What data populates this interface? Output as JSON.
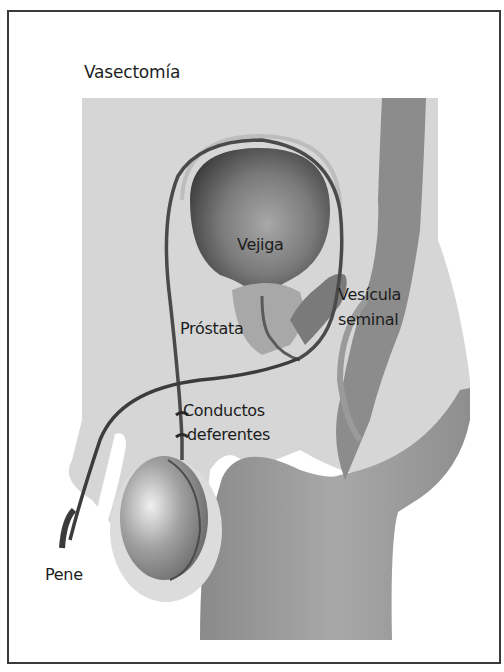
{
  "figure": {
    "title": "Vasectomía",
    "labels": {
      "bladder": "Vejiga",
      "seminal_vesicle_line1": "Vesícula",
      "seminal_vesicle_line2": "seminal",
      "prostate": "Próstata",
      "vas_deferens_line1": "Conductos",
      "vas_deferens_line2": "deferentes",
      "penis": "Pene"
    },
    "colors": {
      "frame": "#3a3a3a",
      "background": "#ffffff",
      "body_light": "#d4d4d4",
      "body_dark": "#8e8e8e",
      "rectum": "#8a8a8a",
      "bladder_dark": "#4a4a4a",
      "duct": "#3c3c3c",
      "text": "#1c1c1c"
    }
  }
}
